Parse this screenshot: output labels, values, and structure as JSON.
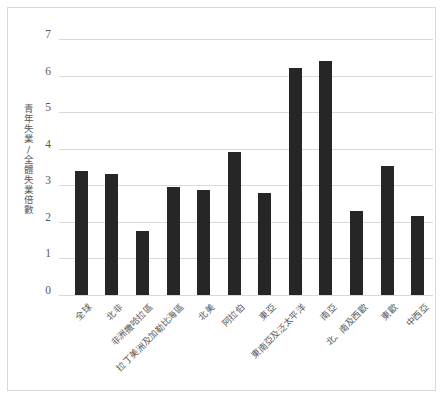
{
  "chart_data": {
    "type": "bar",
    "title": "",
    "xlabel": "",
    "ylabel": "青年失業/全體失業倍數",
    "ylim": [
      0,
      7
    ],
    "ystep": 1,
    "ytick_labels": [
      "7",
      "6",
      "5",
      "4",
      "3",
      "2",
      "1",
      "0"
    ],
    "grid": true,
    "legend": "none",
    "bar_color": "#262626",
    "gridline_color": "#d9d9d9",
    "categories": [
      "全球",
      "北非",
      "非洲撒哈拉區",
      "拉丁美洲及加勒比海區",
      "北美",
      "阿拉伯",
      "東亞",
      "東南亞及泛太平洋",
      "南亞",
      "北、南及西歐",
      "東歐",
      "中西亞"
    ],
    "values": [
      3.4,
      3.3,
      1.75,
      2.95,
      2.87,
      3.9,
      2.8,
      6.22,
      6.4,
      2.3,
      3.53,
      2.17
    ]
  }
}
